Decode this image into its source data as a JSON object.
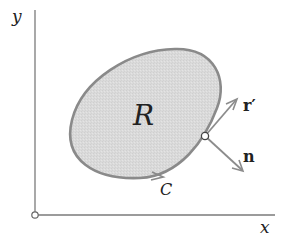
{
  "diagram": {
    "axes": {
      "x_label": "x",
      "y_label": "y"
    },
    "region": {
      "label": "R",
      "fill_color": "#d9d9d9",
      "stroke_color": "#888888"
    },
    "curve": {
      "label": "C"
    },
    "vectors": {
      "tangent_label": "r′",
      "normal_label": "n"
    },
    "colors": {
      "axis": "#777777",
      "vector": "#8c8c8c",
      "text": "#222222"
    }
  }
}
